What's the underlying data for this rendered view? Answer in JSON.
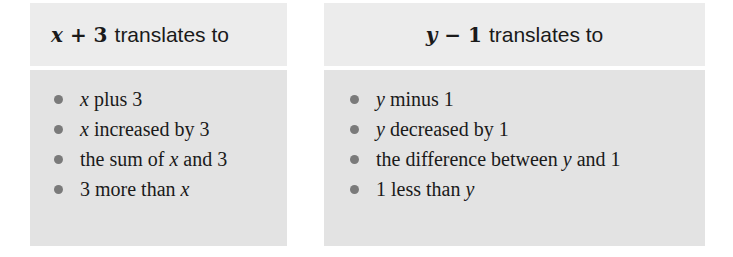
{
  "cards": [
    {
      "header_math_var": "x",
      "header_math_rest": " + 3",
      "header_text": "translates to",
      "items": [
        {
          "pre": "",
          "var": "x",
          "post": " plus 3"
        },
        {
          "pre": "",
          "var": "x",
          "post": " increased by 3"
        },
        {
          "pre": "the sum of ",
          "var": "x",
          "post": " and 3"
        },
        {
          "pre": "3 more than ",
          "var": "x",
          "post": ""
        }
      ]
    },
    {
      "header_math_var": "y",
      "header_math_rest": " − 1",
      "header_text": "translates to",
      "items": [
        {
          "pre": "",
          "var": "y",
          "post": " minus 1"
        },
        {
          "pre": "",
          "var": "y",
          "post": " decreased by 1"
        },
        {
          "pre": "the difference between ",
          "var": "y",
          "post": " and 1"
        },
        {
          "pre": "1 less than ",
          "var": "y",
          "post": ""
        }
      ]
    }
  ],
  "colors": {
    "header_bg": "#ececec",
    "body_bg": "#e3e3e3",
    "bullet": "#7a7a7a"
  }
}
